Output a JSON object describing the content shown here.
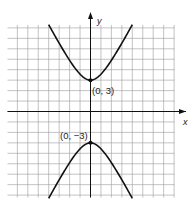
{
  "chart_data": {
    "type": "line",
    "title": "",
    "xlabel": "x",
    "ylabel": "y",
    "xlim": [
      -8,
      8
    ],
    "ylim": [
      -8.2,
      8.3
    ],
    "grid": true,
    "series": [
      {
        "name": "upper branch",
        "x": [
          -4,
          -3,
          -2,
          -1,
          0,
          1,
          2,
          3,
          4
        ],
        "y": [
          8.2,
          6.7,
          4.9,
          3.6,
          3,
          3.6,
          4.9,
          6.7,
          8.2
        ]
      },
      {
        "name": "lower branch",
        "x": [
          -4,
          -3,
          -2,
          -1,
          0,
          1,
          2,
          3,
          4
        ],
        "y": [
          -8.2,
          -6.7,
          -4.9,
          -3.6,
          -3,
          -3.6,
          -4.9,
          -6.7,
          -8.2
        ]
      }
    ],
    "annotations": [
      {
        "text": "(0, 3)",
        "x": 0,
        "y": 3
      },
      {
        "text": "(0, −3)",
        "x": 0,
        "y": -3
      }
    ]
  },
  "labels": {
    "x_axis": "x",
    "y_axis": "y",
    "upper_vertex": "(0, 3)",
    "lower_vertex": "(0, −3)"
  }
}
